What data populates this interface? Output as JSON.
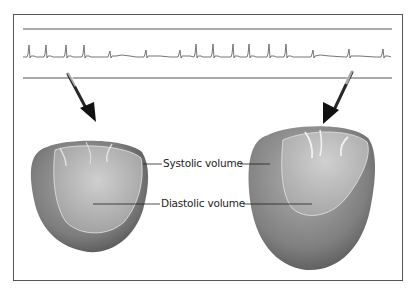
{
  "figure": {
    "labels": {
      "systolic": "Systolic volume",
      "diastolic": "Diastolic volume"
    },
    "ecg": {
      "description": "ECG rhythm strip between two horizontal rules",
      "beats_x": [
        29,
        46,
        66,
        84,
        110,
        146,
        181,
        196,
        213,
        233,
        249,
        269,
        286,
        313,
        349,
        384
      ]
    },
    "hearts": [
      {
        "name": "left-ventricle-small",
        "state": "normal"
      },
      {
        "name": "left-ventricle-dilated",
        "state": "dilated"
      }
    ],
    "colors": {
      "border": "#555555",
      "ecg": "#666666",
      "arrow": "#111111",
      "heart_outer": "#7a7a7a",
      "heart_inner": "#b5b5b5"
    }
  }
}
